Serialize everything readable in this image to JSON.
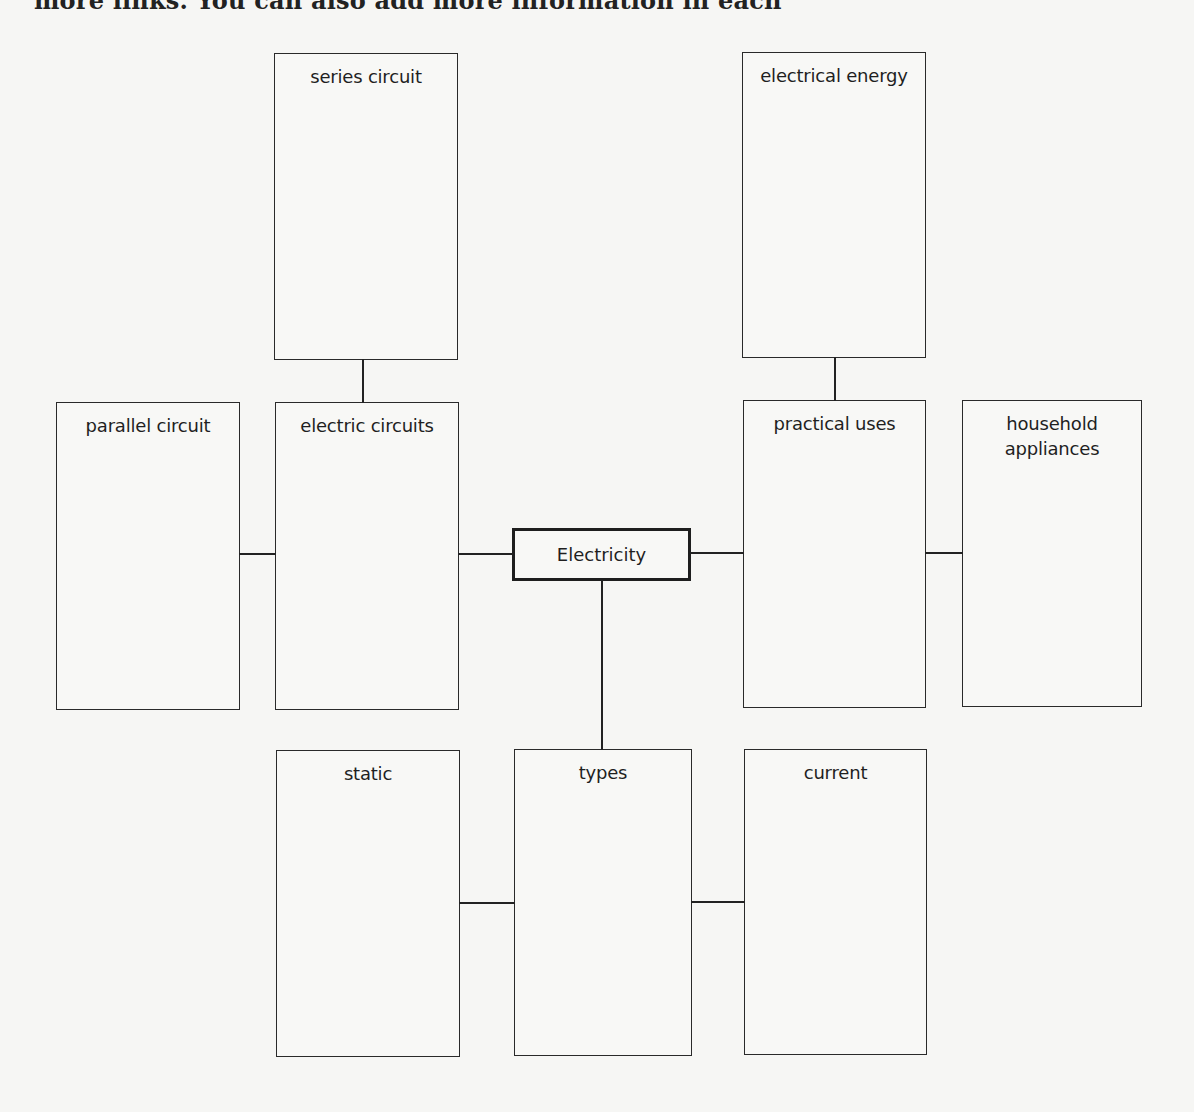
{
  "header": {
    "cut_off_text": "more links. You can also add more information in each"
  },
  "diagram": {
    "center": {
      "label": "Electricity"
    },
    "nodes": {
      "series_circuit": {
        "label": "series circuit"
      },
      "electrical_energy": {
        "label": "electrical energy"
      },
      "parallel_circuit": {
        "label": "parallel circuit"
      },
      "electric_circuits": {
        "label": "electric circuits"
      },
      "practical_uses": {
        "label": "practical uses"
      },
      "household_appliances": {
        "label": "household appliances"
      },
      "static": {
        "label": "static"
      },
      "types": {
        "label": "types"
      },
      "current": {
        "label": "current"
      }
    },
    "connections": [
      [
        "Electricity",
        "electric circuits"
      ],
      [
        "Electricity",
        "practical uses"
      ],
      [
        "Electricity",
        "types"
      ],
      [
        "electric circuits",
        "series circuit"
      ],
      [
        "electric circuits",
        "parallel circuit"
      ],
      [
        "practical uses",
        "electrical energy"
      ],
      [
        "practical uses",
        "household appliances"
      ],
      [
        "types",
        "static"
      ],
      [
        "types",
        "current"
      ]
    ]
  }
}
